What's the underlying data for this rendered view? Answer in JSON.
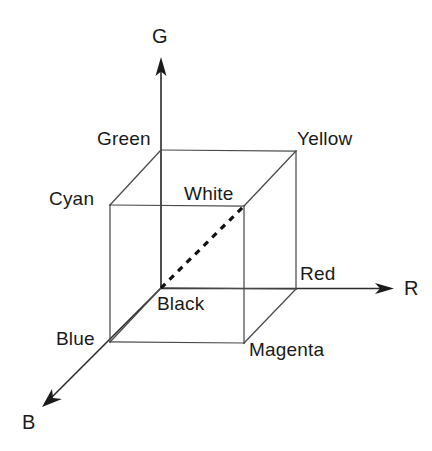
{
  "diagram": {
    "type": "rgb-color-cube",
    "background_color": "#ffffff",
    "edge_color": "#4a4a4a",
    "axis_color": "#2b2b2b",
    "text_color": "#1a1a1a",
    "axes": [
      {
        "key": "g",
        "label": "G",
        "name": "green-axis",
        "direction": "up"
      },
      {
        "key": "r",
        "label": "R",
        "name": "red-axis",
        "direction": "right"
      },
      {
        "key": "b",
        "label": "B",
        "name": "blue-axis",
        "direction": "down-left"
      }
    ],
    "vertices": [
      {
        "key": "green",
        "label": "Green",
        "rgb": "#00ff00"
      },
      {
        "key": "yellow",
        "label": "Yellow",
        "rgb": "#ffff00"
      },
      {
        "key": "cyan",
        "label": "Cyan",
        "rgb": "#00ffff"
      },
      {
        "key": "white",
        "label": "White",
        "rgb": "#ffffff"
      },
      {
        "key": "black",
        "label": "Black",
        "rgb": "#000000"
      },
      {
        "key": "red",
        "label": "Red",
        "rgb": "#ff0000"
      },
      {
        "key": "blue",
        "label": "Blue",
        "rgb": "#0000ff"
      },
      {
        "key": "magenta",
        "label": "Magenta",
        "rgb": "#ff00ff"
      }
    ],
    "grayscale_diagonal": {
      "from": "Black",
      "to": "White",
      "style": "dashed"
    }
  }
}
